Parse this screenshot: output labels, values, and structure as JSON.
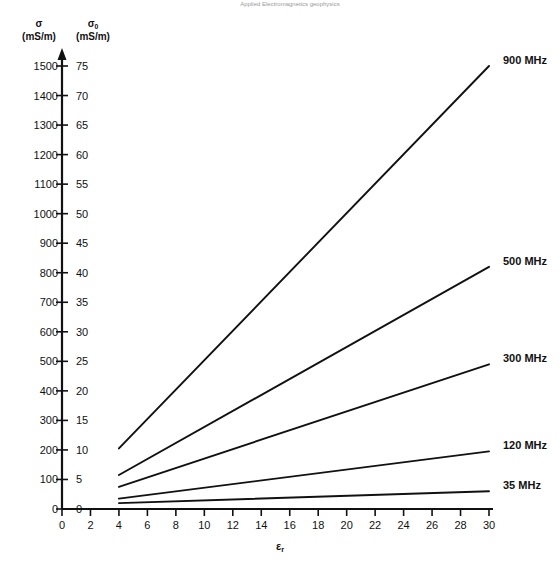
{
  "header": {
    "note": "Applied Electromagnetics geophysics"
  },
  "axes": {
    "left_title_symbol": "σ",
    "left_title_unit": "(mS/m)",
    "right_title_symbol": "σ",
    "right_title_subscript": "0",
    "right_title_unit": "(mS/m)",
    "x_title_symbol": "ε",
    "x_title_subscript": "r"
  },
  "chart_data": {
    "type": "line",
    "title": "",
    "xlabel": "εr",
    "ylabel": "σ (mS/m)",
    "y2label": "σ0 (mS/m)",
    "xlim": [
      0,
      30
    ],
    "ylim": [
      0,
      1500
    ],
    "y2lim": [
      0,
      75
    ],
    "grid": false,
    "legend_position": "right-inline",
    "xticks": [
      0,
      2,
      4,
      6,
      8,
      10,
      12,
      14,
      16,
      18,
      20,
      22,
      24,
      26,
      28,
      30
    ],
    "yticks_left": [
      0,
      100,
      200,
      300,
      400,
      500,
      600,
      700,
      800,
      900,
      1000,
      1100,
      1200,
      1300,
      1400,
      1500
    ],
    "yticks_right": [
      0,
      5,
      10,
      15,
      20,
      25,
      30,
      35,
      40,
      45,
      50,
      55,
      60,
      65,
      70,
      75
    ],
    "x": [
      4,
      30
    ],
    "series": [
      {
        "name": "900 MHz",
        "label": "900 MHz",
        "values": [
          205,
          1500
        ]
      },
      {
        "name": "500 MHz",
        "label": "500 MHz",
        "values": [
          115,
          820
        ]
      },
      {
        "name": "300 MHz",
        "label": "300 MHz",
        "values": [
          75,
          490
        ]
      },
      {
        "name": "120 MHz",
        "label": "120 MHz",
        "values": [
          35,
          195
        ]
      },
      {
        "name": "35 MHz",
        "label": "35 MHz",
        "values": [
          20,
          60
        ]
      }
    ]
  }
}
